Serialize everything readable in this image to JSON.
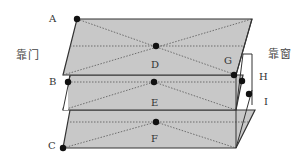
{
  "diagram": {
    "type": "stacked-layer measurement diagram",
    "side_labels": {
      "left": "靠门",
      "right": "靠窗"
    },
    "points": [
      {
        "id": "A",
        "label": "A",
        "x": 77,
        "y": 19
      },
      {
        "id": "B",
        "label": "B",
        "x": 68,
        "y": 82
      },
      {
        "id": "C",
        "label": "C",
        "x": 63,
        "y": 148
      },
      {
        "id": "D",
        "label": "D",
        "x": 156,
        "y": 46
      },
      {
        "id": "E",
        "label": "E",
        "x": 154,
        "y": 82
      },
      {
        "id": "F",
        "label": "F",
        "x": 156,
        "y": 122
      },
      {
        "id": "G",
        "label": "G",
        "x": 234,
        "y": 75
      },
      {
        "id": "H",
        "label": "H",
        "x": 242,
        "y": 81
      },
      {
        "id": "I",
        "label": "I",
        "x": 249,
        "y": 94
      }
    ],
    "layers": [
      "top",
      "middle",
      "bottom"
    ],
    "colors": {
      "fill": "#c8c8c8",
      "edge": "#333333",
      "dashed": "#555555",
      "point": "#111111",
      "background": "#ffffff"
    }
  }
}
